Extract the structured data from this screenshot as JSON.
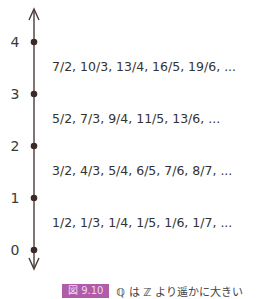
{
  "figure": {
    "caption_number": "図 9.10",
    "caption_text": "ℚ は ℤ より遥かに大きい",
    "accent_color": "#b05ca8"
  },
  "axis": {
    "ticks": [
      "4",
      "3",
      "2",
      "1",
      "0"
    ]
  },
  "rows": [
    {
      "between": "3-4",
      "text": "7/2, 10/3, 13/4, 16/5, 19/6, ..."
    },
    {
      "between": "2-3",
      "text": "5/2, 7/3, 9/4, 11/5, 13/6, ..."
    },
    {
      "between": "1-2",
      "text": "3/2, 4/3, 5/4, 6/5, 7/6, 8/7, ..."
    },
    {
      "between": "0-1",
      "text": "1/2, 1/3, 1/4, 1/5, 1/6, 1/7, ..."
    }
  ]
}
